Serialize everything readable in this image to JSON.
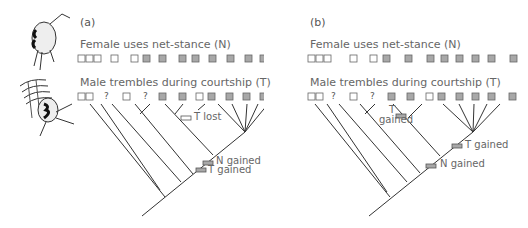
{
  "figure": {
    "panels": [
      {
        "id": "a",
        "letter": "(a)",
        "trait_n_title": "Female uses net-stance (N)",
        "trait_t_title": "Male trembles during courtship (T)",
        "annotations": {
          "t_lost": "T lost",
          "n_gained": "N gained",
          "t_gained": "T gained"
        }
      },
      {
        "id": "b",
        "letter": "(b)",
        "trait_n_title": "Female uses net-stance (N)",
        "trait_t_title": "Male trembles during courtship (T)",
        "annotations": {
          "t_gained_upper_line1": "T",
          "t_gained_upper_line2": "gained",
          "t_gained": "T gained",
          "n_gained": "N gained"
        }
      }
    ],
    "tips": {
      "x_positions": [
        78,
        86,
        103,
        120,
        141,
        158,
        177,
        196,
        210,
        226,
        242,
        258,
        279
      ],
      "trait_N_states": [
        "absent",
        "absent",
        "absent",
        "absent",
        "absent",
        "present",
        "present",
        "present",
        "present",
        "present",
        "present",
        "present",
        "present"
      ],
      "trait_T_states": [
        "absent",
        "absent",
        "unknown",
        "absent",
        "unknown",
        "present",
        "present",
        "absent",
        "present",
        "present",
        "present",
        "present",
        "present"
      ]
    },
    "legend": {
      "absent_color": "#ffffff",
      "present_color": "#a8a8a8",
      "box_border": "#666666",
      "unknown_symbol": "?"
    },
    "illustrations": {
      "female_spider": "spider-net-stance-illustration",
      "male_spider": "spider-trembling-illustration"
    }
  }
}
